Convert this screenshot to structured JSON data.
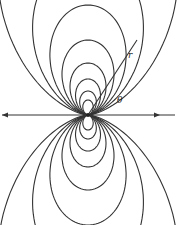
{
  "diagram": {
    "labels": {
      "r": "r",
      "theta": "θ"
    },
    "center": {
      "x": 88,
      "y": 115
    },
    "loops": [
      {
        "k": 110
      },
      {
        "k": 75
      },
      {
        "k": 52
      },
      {
        "k": 36
      },
      {
        "k": 24
      },
      {
        "k": 15
      }
    ],
    "stroke_color": "#333333"
  }
}
